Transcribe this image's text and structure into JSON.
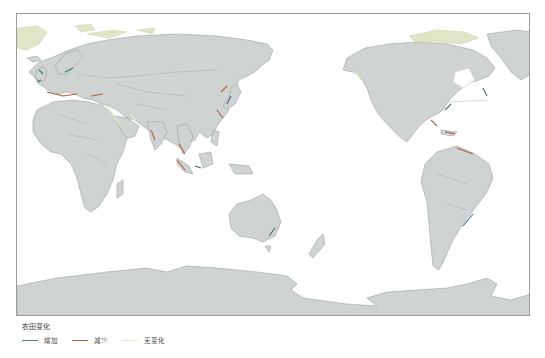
{
  "map": {
    "type": "world-coastline-change",
    "projection": "pacific-centered",
    "land_color": "#cfd3d2",
    "ocean_color": "#ffffff"
  },
  "legend": {
    "title": "农田变化",
    "items": [
      {
        "label": "增加",
        "color": "#5a7a92"
      },
      {
        "label": "减少",
        "color": "#b55a3a"
      },
      {
        "label": "无变化",
        "color": "#e4ecc4"
      }
    ]
  }
}
